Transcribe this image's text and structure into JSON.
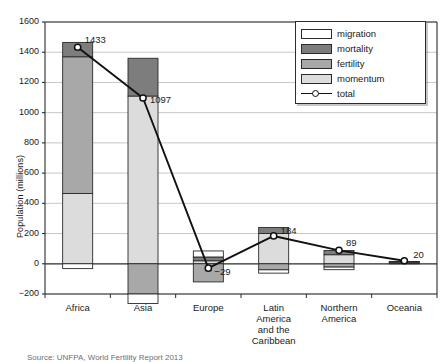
{
  "chart_data": {
    "type": "bar",
    "title": "",
    "subtitle": "",
    "xlabel": "",
    "ylabel": "Population (millions)",
    "ylim": [
      -200,
      1600
    ],
    "yticks": [
      -200,
      0,
      200,
      400,
      600,
      800,
      1000,
      1200,
      1400,
      1600
    ],
    "ytick_labels": [
      "−200",
      "0",
      "200",
      "400",
      "600",
      "800",
      "1000",
      "1200",
      "1400",
      "1600"
    ],
    "grid": true,
    "grid_axis": "y",
    "stacked": true,
    "legend_position": "top-right",
    "legend_entries": [
      "migration",
      "mortality",
      "fertility",
      "momentum",
      "total"
    ],
    "categories": [
      "Africa",
      "Asia",
      "Europe",
      "Latin\nAmerica\nand the\nCaribbean",
      "Northern\nAmerica",
      "Oceania"
    ],
    "series": [
      {
        "name": "migration",
        "color": "#ffffff",
        "values": [
          -32,
          -63,
          40,
          -22,
          -17,
          2
        ]
      },
      {
        "name": "mortality",
        "color": "#7d7d7d",
        "values": [
          95,
          250,
          25,
          40,
          28,
          3
        ]
      },
      {
        "name": "fertility",
        "color": "#a8a8a8",
        "values": [
          905,
          -200,
          -120,
          -40,
          -22,
          4
        ]
      },
      {
        "name": "momentum",
        "color": "#dcdcdc",
        "values": [
          465,
          1110,
          20,
          200,
          60,
          6
        ]
      }
    ],
    "overlay_line": {
      "name": "total",
      "marker": "circle",
      "marker_face": "#ffffff",
      "line_color": "#111111",
      "values": [
        1433,
        1097,
        -29,
        184,
        89,
        20
      ],
      "labels": [
        "1433",
        "1097",
        "−29",
        "184",
        "89",
        "20"
      ]
    }
  },
  "colors": {
    "migration": "#ffffff",
    "mortality": "#7d7d7d",
    "fertility": "#a8a8a8",
    "momentum": "#dcdcdc",
    "line": "#111111",
    "grid": "#b9b9b9",
    "axis": "#2b2b2b"
  },
  "legend": {
    "items": [
      {
        "label": "migration",
        "kind": "swatch",
        "color": "#ffffff"
      },
      {
        "label": "mortality",
        "kind": "swatch",
        "color": "#7d7d7d"
      },
      {
        "label": "fertility",
        "kind": "swatch",
        "color": "#a8a8a8"
      },
      {
        "label": "momentum",
        "kind": "swatch",
        "color": "#dcdcdc"
      },
      {
        "label": "total",
        "kind": "line",
        "color": "#111111"
      }
    ]
  },
  "source": {
    "text": "Source: UNFPA, World Fertility Report 2013"
  }
}
